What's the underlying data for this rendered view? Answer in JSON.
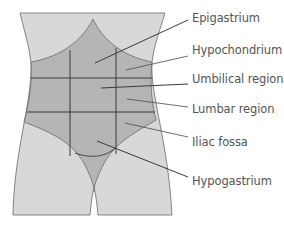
{
  "diagram": {
    "title": "",
    "colors": {
      "background": "#ffffff",
      "skin_light": "#d8d8d8",
      "abdomen": "#b5b5b5",
      "outline": "#6a6a6a",
      "grid_lines": "#3a3a3a",
      "leader_lines": "#4a4a4a",
      "label_text": "#555555"
    },
    "labels": [
      {
        "id": "epigastrium",
        "text": "Epigastrium",
        "y": 13
      },
      {
        "id": "hypochondrium",
        "text": "Hypochondrium",
        "y": 45
      },
      {
        "id": "umbilical",
        "text": "Umbilical region",
        "y": 74
      },
      {
        "id": "lumbar",
        "text": "Lumbar region",
        "y": 104
      },
      {
        "id": "iliac",
        "text": "Iliac fossa",
        "y": 137
      },
      {
        "id": "hypogastrium",
        "text": "Hypogastrium",
        "y": 176
      }
    ]
  }
}
